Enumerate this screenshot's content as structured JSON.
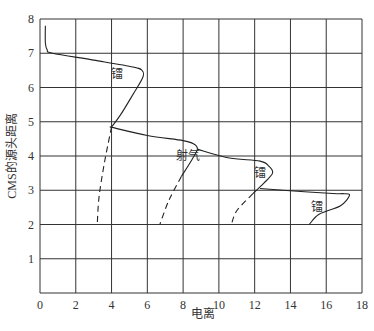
{
  "chart_data": {
    "type": "line",
    "title": "",
    "xlabel": "电离",
    "ylabel": "CMS的源头距离",
    "xlim": [
      0,
      18
    ],
    "ylim": [
      0,
      8
    ],
    "xticks": [
      0,
      2,
      4,
      6,
      8,
      10,
      12,
      14,
      16,
      18
    ],
    "yticks": [
      1,
      2,
      3,
      4,
      5,
      6,
      7,
      8
    ],
    "grid": true,
    "legend": null,
    "annotations": [
      {
        "text": "镭",
        "x": 4.3,
        "y": 6.4
      },
      {
        "text": "射气",
        "x": 8.3,
        "y": 4.0
      },
      {
        "text": "镭",
        "x": 12.3,
        "y": 3.5
      },
      {
        "text": "镭",
        "x": 15.5,
        "y": 2.5
      }
    ],
    "series": [
      {
        "name": "镭",
        "style": "solid",
        "points": [
          [
            0.3,
            7.8
          ],
          [
            0.3,
            7.3
          ],
          [
            0.4,
            7.1
          ],
          [
            0.7,
            7.0
          ],
          [
            3.0,
            6.8
          ],
          [
            5.2,
            6.6
          ],
          [
            5.7,
            6.5
          ],
          [
            5.75,
            6.3
          ],
          [
            5.2,
            5.8
          ],
          [
            4.5,
            5.2
          ],
          [
            4.0,
            4.85
          ]
        ]
      },
      {
        "name": "镭-dashed",
        "style": "dashed",
        "points": [
          [
            4.0,
            4.85
          ],
          [
            3.6,
            3.8
          ],
          [
            3.3,
            2.8
          ],
          [
            3.2,
            2.0
          ]
        ]
      },
      {
        "name": "射气",
        "style": "solid",
        "points": [
          [
            3.9,
            4.85
          ],
          [
            6.0,
            4.6
          ],
          [
            8.0,
            4.45
          ],
          [
            8.6,
            4.35
          ],
          [
            8.8,
            4.2
          ],
          [
            8.5,
            3.9
          ],
          [
            7.9,
            3.4
          ]
        ]
      },
      {
        "name": "射气-dashed",
        "style": "dashed",
        "points": [
          [
            7.9,
            3.4
          ],
          [
            7.2,
            2.7
          ],
          [
            6.7,
            2.0
          ]
        ]
      },
      {
        "name": "镭2",
        "style": "solid",
        "points": [
          [
            8.8,
            4.2
          ],
          [
            10.5,
            3.95
          ],
          [
            12.3,
            3.85
          ],
          [
            12.8,
            3.7
          ],
          [
            13.0,
            3.5
          ],
          [
            12.5,
            3.2
          ],
          [
            11.9,
            2.9
          ]
        ]
      },
      {
        "name": "镭2-dashed",
        "style": "dashed",
        "points": [
          [
            11.9,
            2.9
          ],
          [
            11.0,
            2.4
          ],
          [
            10.7,
            2.0
          ]
        ]
      },
      {
        "name": "镭3",
        "style": "solid",
        "points": [
          [
            12.3,
            3.05
          ],
          [
            15.0,
            2.95
          ],
          [
            16.6,
            2.9
          ],
          [
            17.0,
            2.9
          ],
          [
            17.3,
            2.85
          ],
          [
            16.8,
            2.55
          ],
          [
            15.6,
            2.3
          ],
          [
            15.05,
            2.0
          ]
        ]
      }
    ]
  }
}
